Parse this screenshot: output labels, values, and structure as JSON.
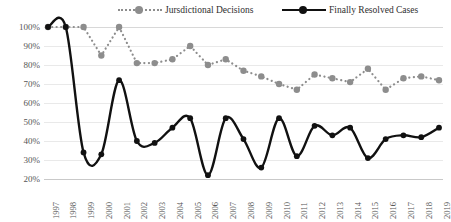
{
  "legend": {
    "entries": [
      {
        "label": "Jursdictional Decisions",
        "style": "dotted",
        "color": "#8d8d8d"
      },
      {
        "label": "Finally Resolved Cases",
        "style": "solid",
        "color": "#111111"
      }
    ]
  },
  "axis": {
    "y_ticks": [
      "100%",
      "90%",
      "80%",
      "70%",
      "60%",
      "50%",
      "40%",
      "30%",
      "20%"
    ],
    "x_ticks": [
      "1997",
      "1998",
      "1999",
      "2000",
      "2001",
      "2002",
      "2003",
      "2004",
      "2005",
      "2006",
      "2007",
      "2008",
      "2009",
      "2010",
      "2011",
      "2012",
      "2013",
      "2014",
      "2015",
      "2016",
      "2017",
      "2018",
      "2019"
    ]
  },
  "chart_data": {
    "type": "line",
    "title": "",
    "xlabel": "",
    "ylabel": "",
    "ylim": [
      20,
      100
    ],
    "y_unit": "%",
    "grid": true,
    "legend_position": "top",
    "categories": [
      "1997",
      "1998",
      "1999",
      "2000",
      "2001",
      "2002",
      "2003",
      "2004",
      "2005",
      "2006",
      "2007",
      "2008",
      "2009",
      "2010",
      "2011",
      "2012",
      "2013",
      "2014",
      "2015",
      "2016",
      "2017",
      "2018",
      "2019"
    ],
    "series": [
      {
        "name": "Jursdictional Decisions",
        "color": "#8d8d8d",
        "line_style": "dotted",
        "values": [
          100,
          100,
          100,
          85,
          100,
          81,
          81,
          83,
          90,
          80,
          83,
          77,
          74,
          70,
          67,
          75,
          73,
          71,
          78,
          67,
          73,
          74,
          72
        ]
      },
      {
        "name": "Finally Resolved Cases",
        "color": "#111111",
        "line_style": "solid",
        "values": [
          100,
          100,
          34,
          33,
          72,
          40,
          39,
          47,
          52,
          22,
          52,
          41,
          26,
          52,
          32,
          48,
          43,
          47,
          31,
          41,
          43,
          42,
          47
        ]
      }
    ]
  }
}
